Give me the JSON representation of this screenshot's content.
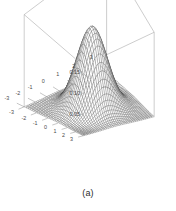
{
  "figure": {
    "caption": "(a)",
    "background_color": "#ffffff",
    "mesh_color": "#3a3a3a",
    "frame_color": "#9a9a9a",
    "tick_label_color": "#4a4a4a"
  },
  "chart_data": {
    "type": "surface",
    "title": "",
    "subtitle": "",
    "xlabel": "",
    "ylabel": "",
    "zlabel": "",
    "projection": "perspective-3d",
    "grid": false,
    "legend": false,
    "legend_position": "none",
    "xlim": [
      -3,
      3
    ],
    "ylim": [
      -3,
      3
    ],
    "zlim": [
      0,
      0.16
    ],
    "x_ticks": [
      -3,
      -2,
      -1,
      0,
      1,
      2,
      3
    ],
    "x_tick_labels": [
      "-3",
      "-2",
      "-1",
      "0",
      "1",
      "2",
      "3"
    ],
    "y_ticks": [
      3,
      2,
      1,
      0,
      -1,
      -2,
      -3
    ],
    "y_tick_labels": [
      "3",
      "2",
      "1",
      "0",
      "-1",
      "-2",
      "-3"
    ],
    "z_ticks": [
      0.05,
      0.1,
      0.15
    ],
    "z_tick_labels": [
      "0.05",
      "0.10",
      "0.15"
    ],
    "peak_value": 0.159,
    "peak_location": [
      0,
      0
    ],
    "surface_function": "z = (1/(2*pi)) * exp(-(x^2 + y^2)/2)",
    "mesh_resolution": [
      40,
      40
    ],
    "annotations": []
  },
  "axes": {
    "z_axis": {
      "name": "z-axis",
      "ticks": [
        {
          "label": "0.15",
          "value": 0.15
        },
        {
          "label": "0.10",
          "value": 0.1
        },
        {
          "label": "0.05",
          "value": 0.05
        }
      ]
    },
    "y_axis_left": {
      "name": "left-front-axis",
      "ticks": [
        {
          "label": "3",
          "value": 3
        },
        {
          "label": "2",
          "value": 2
        },
        {
          "label": "1",
          "value": 1
        },
        {
          "label": "0",
          "value": 0
        },
        {
          "label": "-1",
          "value": -1
        },
        {
          "label": "-2",
          "value": -2
        },
        {
          "label": "-3",
          "value": -3
        }
      ]
    },
    "x_axis_right": {
      "name": "right-front-axis",
      "ticks": [
        {
          "label": "-3",
          "value": -3
        },
        {
          "label": "-2",
          "value": -2
        },
        {
          "label": "-1",
          "value": -1
        },
        {
          "label": "0",
          "value": 0
        },
        {
          "label": "1",
          "value": 1
        },
        {
          "label": "2",
          "value": 2
        },
        {
          "label": "3",
          "value": 3
        }
      ]
    }
  }
}
